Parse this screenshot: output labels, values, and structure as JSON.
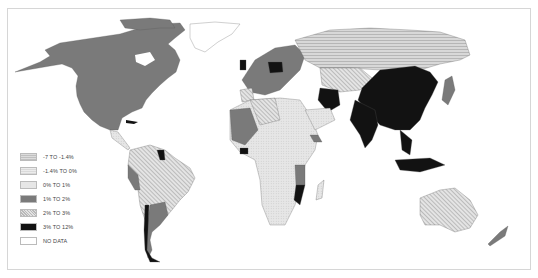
{
  "map": {
    "type": "choropleth-world-map",
    "colors": {
      "neg7_to_neg1_4": "#c8c8c8",
      "neg1_4_to_0": "#e2e2e2",
      "0_to_1": "#dcdcdc",
      "1_to_2": "#7a7a7a",
      "2_to_3": "#d0d0d0",
      "3_to_12": "#121212",
      "no_data": "#ffffff",
      "border": "#555555",
      "frame": "#d6d6d6"
    }
  },
  "legend": {
    "items": [
      {
        "label": "-7 TO -1.4%",
        "color": "#c8c8c8",
        "pattern": "horizontal-hatch"
      },
      {
        "label": "-1.4% TO 0%",
        "color": "#e2e2e2",
        "pattern": "fine-horizontal"
      },
      {
        "label": "0% TO 1%",
        "color": "#dcdcdc",
        "pattern": "dots"
      },
      {
        "label": "1% TO 2%",
        "color": "#7a7a7a",
        "pattern": "solid"
      },
      {
        "label": "2% TO 3%",
        "color": "#d0d0d0",
        "pattern": "diagonal-hatch"
      },
      {
        "label": "3% TO 12%",
        "color": "#121212",
        "pattern": "solid"
      },
      {
        "label": "NO DATA",
        "color": "#ffffff",
        "pattern": "none"
      }
    ]
  }
}
